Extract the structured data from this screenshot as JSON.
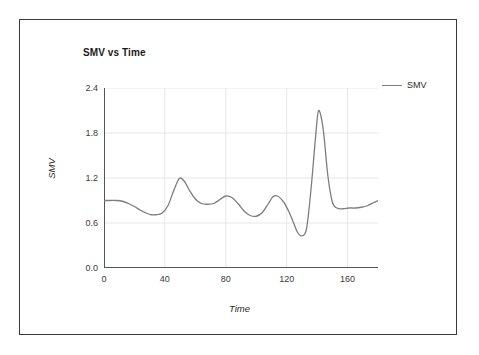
{
  "chart_data": {
    "type": "line",
    "title": "SMV vs Time",
    "xlabel": "Time",
    "ylabel": "SMV",
    "xlim": [
      0,
      180
    ],
    "ylim": [
      0.0,
      2.4
    ],
    "grid": true,
    "legend_position": "right",
    "x_ticks": [
      "0",
      "40",
      "80",
      "120",
      "160"
    ],
    "x_tick_values": [
      0,
      40,
      80,
      120,
      160
    ],
    "y_ticks": [
      "0.0",
      "0.6",
      "1.2",
      "1.8",
      "2.4"
    ],
    "y_tick_values": [
      0.0,
      0.6,
      1.2,
      1.8,
      2.4
    ],
    "series": [
      {
        "name": "SMV",
        "color": "#7d7d7d",
        "x": [
          0,
          4,
          8,
          12,
          16,
          20,
          24,
          28,
          31,
          34,
          38,
          42,
          45,
          48,
          50,
          53,
          56,
          60,
          64,
          68,
          72,
          76,
          80,
          84,
          88,
          92,
          96,
          100,
          104,
          108,
          111,
          114,
          118,
          121,
          124,
          127,
          130,
          133,
          136,
          139,
          141,
          144,
          147,
          150,
          153,
          157,
          161,
          165,
          169,
          173,
          177,
          180
        ],
        "y": [
          0.9,
          0.9,
          0.9,
          0.89,
          0.86,
          0.82,
          0.77,
          0.73,
          0.71,
          0.71,
          0.73,
          0.83,
          0.99,
          1.14,
          1.2,
          1.15,
          1.04,
          0.92,
          0.86,
          0.85,
          0.86,
          0.91,
          0.96,
          0.94,
          0.86,
          0.76,
          0.7,
          0.69,
          0.74,
          0.86,
          0.95,
          0.96,
          0.88,
          0.77,
          0.63,
          0.48,
          0.43,
          0.52,
          1.05,
          1.75,
          2.1,
          1.85,
          1.24,
          0.88,
          0.8,
          0.79,
          0.8,
          0.8,
          0.81,
          0.83,
          0.87,
          0.9
        ]
      }
    ]
  },
  "legend": {
    "entries": [
      {
        "label": "SMV"
      }
    ]
  }
}
